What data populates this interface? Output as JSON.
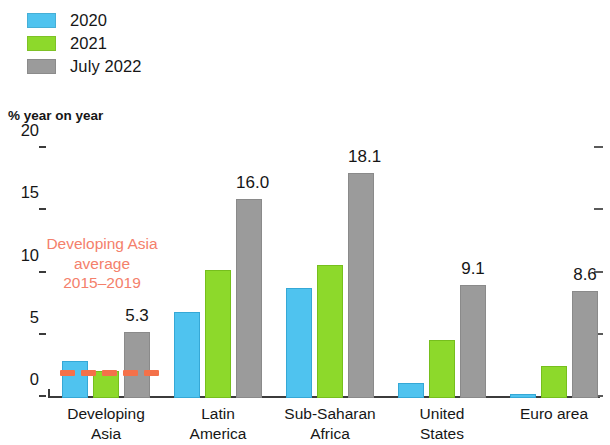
{
  "legend": {
    "items": [
      {
        "label": "2020",
        "color": "#4FC3EF",
        "key": "2020"
      },
      {
        "label": "2021",
        "color": "#8DD92B",
        "key": "2021"
      },
      {
        "label": "July 2022",
        "color": "#9B9B9B",
        "key": "july-2022"
      }
    ]
  },
  "axis": {
    "unit_caption": "% year on year",
    "y_ticks": [
      "0",
      "5",
      "10",
      "15",
      "20"
    ]
  },
  "annotation": {
    "line1": "Developing Asia",
    "line2": "average",
    "line3": "2015–2019",
    "color": "#F4806B",
    "line_color": "#F4714A",
    "value": 2.0
  },
  "categories": [
    {
      "line1": "Developing",
      "line2": "Asia"
    },
    {
      "line1": "Latin",
      "line2": "America"
    },
    {
      "line1": "Sub-Saharan",
      "line2": "Africa"
    },
    {
      "line1": "United",
      "line2": "States"
    },
    {
      "line1": "Euro area",
      "line2": ""
    }
  ],
  "bar_labels": [
    "5.3",
    "16.0",
    "18.1",
    "9.1",
    "8.6"
  ],
  "chart_data": {
    "type": "bar",
    "title": "",
    "subtitle": "",
    "xlabel": "",
    "ylabel": "% year on year",
    "ylim": [
      0,
      20
    ],
    "yticks": [
      0,
      5,
      10,
      15,
      20
    ],
    "grid": false,
    "legend_position": "top-left",
    "categories": [
      "Developing Asia",
      "Latin America",
      "Sub-Saharan Africa",
      "United States",
      "Euro area"
    ],
    "series": [
      {
        "name": "2020",
        "color": "#4FC3EF",
        "values": [
          3.0,
          6.9,
          8.8,
          1.2,
          0.3
        ]
      },
      {
        "name": "2021",
        "color": "#8DD92B",
        "values": [
          2.2,
          10.3,
          10.7,
          4.7,
          2.6
        ]
      },
      {
        "name": "July 2022",
        "color": "#9B9B9B",
        "values": [
          5.3,
          16.0,
          18.1,
          9.1,
          8.6
        ]
      }
    ],
    "data_labels": {
      "series": "July 2022",
      "values": [
        "5.3",
        "16.0",
        "18.1",
        "9.1",
        "8.6"
      ]
    },
    "annotations": [
      {
        "type": "hline",
        "text": "Developing Asia average 2015–2019",
        "value": 2.0,
        "color": "#F4714A",
        "style": "dashed",
        "span_categories": [
          "Developing Asia"
        ]
      }
    ]
  }
}
